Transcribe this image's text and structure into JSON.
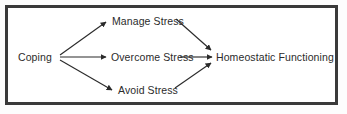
{
  "diagram": {
    "border_color": "#3a3a3a",
    "background_color": "#ffffff",
    "text_color": "#2b2b2b",
    "line_color": "#2b2b2b",
    "nodes": [
      {
        "id": "coping",
        "label": "Coping"
      },
      {
        "id": "manage",
        "label": "Manage Stress"
      },
      {
        "id": "overcome",
        "label": "Overcome Stress"
      },
      {
        "id": "avoid",
        "label": "Avoid Stress"
      },
      {
        "id": "homeostatic",
        "label": "Homeostatic Functioning"
      }
    ],
    "edges": [
      {
        "from": "Coping",
        "to": "Manage Stress",
        "style": "diagonal-up",
        "arrowhead": "filled-triangle"
      },
      {
        "from": "Coping",
        "to": "Overcome Stress",
        "style": "horizontal",
        "arrowhead": "filled-triangle"
      },
      {
        "from": "Coping",
        "to": "Avoid Stress",
        "style": "diagonal-down",
        "arrowhead": "filled-triangle"
      },
      {
        "from": "Manage Stress",
        "to": "Homeostatic Functioning",
        "style": "diagonal-down",
        "arrowhead": "filled-triangle"
      },
      {
        "from": "Overcome Stress",
        "to": "Homeostatic Functioning",
        "style": "horizontal",
        "arrowhead": "filled-triangle"
      },
      {
        "from": "Avoid Stress",
        "to": "Homeostatic Functioning",
        "style": "diagonal-up",
        "arrowhead": "filled-triangle"
      }
    ]
  }
}
